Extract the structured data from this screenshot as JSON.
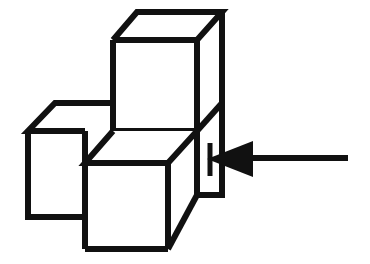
{
  "figure": {
    "title": "Isometric cube stack with pointing arrow",
    "background_color": "#ffffff",
    "line_color": "#111111",
    "face_color": "#ffffff",
    "stroke_width": 6,
    "canvas": {
      "width": 370,
      "height": 264
    },
    "parts": [
      {
        "name": "top-cube",
        "label": "Upper cube",
        "position": "upper-right-back"
      },
      {
        "name": "left-cube",
        "label": "Left cube",
        "position": "lower-left-back"
      },
      {
        "name": "front-cube",
        "label": "Front cube",
        "position": "lower-center-front"
      },
      {
        "name": "arrow",
        "label": "Arrow",
        "direction": "left",
        "points_at": "right vertical face"
      }
    ],
    "geometry": {
      "top_cube": {
        "top_face": [
          [
            137,
            12
          ],
          [
            222,
            12
          ],
          [
            197,
            40
          ],
          [
            113,
            40
          ]
        ],
        "front_face": [
          [
            113,
            40
          ],
          [
            197,
            40
          ],
          [
            197,
            130
          ],
          [
            113,
            130
          ]
        ],
        "right_face": [
          [
            197,
            40
          ],
          [
            222,
            12
          ],
          [
            222,
            103
          ],
          [
            197,
            130
          ]
        ]
      },
      "left_cube": {
        "top_face": [
          [
            55,
            103
          ],
          [
            113,
            103
          ],
          [
            85,
            131
          ],
          [
            28,
            131
          ]
        ],
        "front_face": [
          [
            28,
            131
          ],
          [
            85,
            131
          ],
          [
            85,
            217
          ],
          [
            28,
            217
          ]
        ],
        "hidden_right": [
          [
            85,
            131
          ],
          [
            113,
            103
          ]
        ]
      },
      "front_cube": {
        "top_face": [
          [
            113,
            131
          ],
          [
            197,
            131
          ],
          [
            168,
            163
          ],
          [
            85,
            163
          ]
        ],
        "front_face": [
          [
            85,
            163
          ],
          [
            168,
            163
          ],
          [
            168,
            249
          ],
          [
            85,
            249
          ]
        ],
        "right_face": [
          [
            168,
            163
          ],
          [
            197,
            131
          ],
          [
            197,
            195
          ],
          [
            168,
            249
          ]
        ]
      },
      "lower_right_face": {
        "outline": [
          [
            197,
            130
          ],
          [
            222,
            103
          ],
          [
            222,
            195
          ],
          [
            197,
            195
          ]
        ]
      },
      "arrow": {
        "shaft_start": [
          348,
          158
        ],
        "shaft_end": [
          236,
          158
        ],
        "head_tip": [
          207,
          159
        ],
        "head_back_top": [
          253,
          142
        ],
        "head_back_bottom": [
          253,
          176
        ],
        "tick_top": [
          210,
          143
        ],
        "tick_bottom": [
          210,
          176
        ]
      }
    },
    "cube_count": 3,
    "projection": "isometric"
  }
}
